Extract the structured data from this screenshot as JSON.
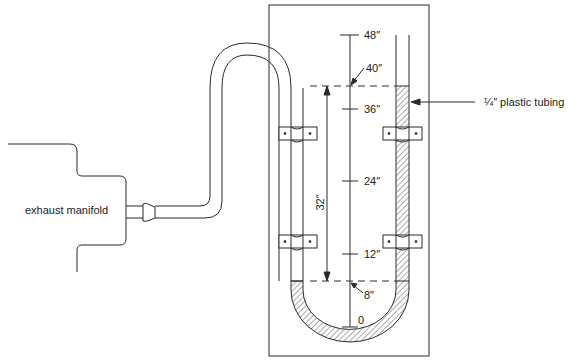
{
  "diagram": {
    "type": "u-tube water manometer connected to exhaust manifold",
    "labels": {
      "manifold": "exhaust manifold",
      "tubing": "¼″ plastic tubing",
      "difference": "32″"
    },
    "scale": {
      "ticks": [
        {
          "value": "48″",
          "inches": 48
        },
        {
          "value": "36″",
          "inches": 36
        },
        {
          "value": "24″",
          "inches": 24
        },
        {
          "value": "12″",
          "inches": 12
        },
        {
          "value": "0",
          "inches": 0
        }
      ],
      "levels": [
        {
          "value": "40″",
          "inches": 40,
          "side": "right (high)"
        },
        {
          "value": "8″",
          "inches": 8,
          "side": "left (low)"
        }
      ]
    },
    "colors": {
      "line": "#2a2a2a",
      "fluid_hatch": "#555555",
      "background": "#ffffff"
    }
  }
}
